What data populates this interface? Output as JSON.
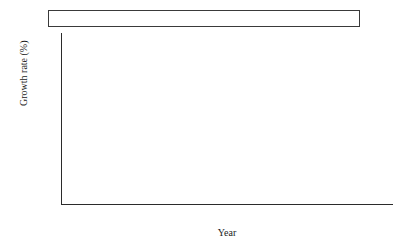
{
  "chart_data": {
    "type": "bar",
    "title": "",
    "subtitle": "",
    "xlabel": "Year",
    "ylabel": "Growth rate (%)",
    "categories": [
      "2010–2020",
      "2020–2030"
    ],
    "ylim": [
      4.0,
      9.0
    ],
    "ytick_step": 0.5,
    "ytick_labels": [
      "9.0",
      "8.5",
      "8.0",
      "7.5",
      "7.0",
      "6.5",
      "6.0",
      "5.5",
      "5.0",
      "4.5",
      "4.0"
    ],
    "ytick_values": [
      9.0,
      8.5,
      8.0,
      7.5,
      7.0,
      6.5,
      6.0,
      5.5,
      5.0,
      4.5,
      4.0
    ],
    "grid": false,
    "legend_position": "top",
    "bar_group_gap": true,
    "series": [
      {
        "name": "National",
        "color": "#cfcfcf",
        "values": [
          8.1,
          5.6
        ],
        "labels": [
          "8.1",
          "5.6"
        ]
      },
      {
        "name": "Eastern",
        "color": "#f5f5f5",
        "values": [
          7.8,
          5.1
        ],
        "labels": [
          "7.8",
          "5.1"
        ]
      },
      {
        "name": "Central",
        "color": "#d9d9d9",
        "values": [
          8.2,
          5.7
        ],
        "labels": [
          "8.2",
          "5.7"
        ]
      },
      {
        "name": "Western",
        "color": "#858585",
        "values": [
          8.5,
          5.8
        ],
        "labels": [
          "8.5",
          "5.8"
        ]
      },
      {
        "name": "Northeastern",
        "color": "#4a4a4a",
        "values": [
          8.4,
          5.9
        ],
        "labels": [
          "8.4",
          "5.9"
        ]
      }
    ]
  },
  "legend": {
    "entries": [
      {
        "label": "National",
        "color": "#cfcfcf"
      },
      {
        "label": "Eastern",
        "color": "#f5f5f5"
      },
      {
        "label": "Central",
        "color": "#d9d9d9"
      },
      {
        "label": "Western",
        "color": "#858585"
      },
      {
        "label": "Northeastern",
        "color": "#4a4a4a"
      }
    ]
  },
  "axes": {
    "y_title": "Growth rate (%)",
    "x_title": "Year"
  }
}
